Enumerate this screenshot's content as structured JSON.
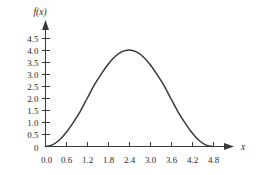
{
  "chart_data": {
    "type": "line",
    "title": "",
    "xlabel": "x",
    "ylabel": "f(x)",
    "xlim": [
      0.0,
      5.1
    ],
    "ylim": [
      0.0,
      4.75
    ],
    "grid": false,
    "legend": null,
    "xticks": [
      "0.0",
      "0.6",
      "1.2",
      "1.8",
      "2.4",
      "3.0",
      "3.6",
      "4.2",
      "4.8"
    ],
    "xtick_values": [
      0.0,
      0.6,
      1.2,
      1.8,
      2.4,
      3.0,
      3.6,
      4.2,
      4.8
    ],
    "yticks": [
      "0",
      "0.5",
      "1.0",
      "1.5",
      "2.0",
      "2.5",
      "3.0",
      "3.5",
      "4.0",
      "4.5"
    ],
    "ytick_values": [
      0.0,
      0.5,
      1.0,
      1.5,
      2.0,
      2.5,
      3.0,
      3.5,
      4.0,
      4.5
    ],
    "curve_color": "#3a3a3a",
    "axis_color": "#3a3a3a",
    "series": [
      {
        "name": "f(x)",
        "x": [
          0.0,
          0.2,
          0.4,
          0.6,
          0.8,
          1.0,
          1.2,
          1.4,
          1.6,
          1.8,
          2.0,
          2.2,
          2.4,
          2.6,
          2.8,
          3.0,
          3.2,
          3.4,
          3.6,
          3.8,
          4.0,
          4.2,
          4.4,
          4.6,
          4.8
        ],
        "values": [
          0.0,
          0.07,
          0.27,
          0.59,
          1.0,
          1.46,
          2.0,
          2.54,
          3.0,
          3.41,
          3.73,
          3.93,
          4.0,
          3.93,
          3.73,
          3.41,
          3.0,
          2.54,
          2.0,
          1.46,
          1.0,
          0.59,
          0.27,
          0.07,
          0.0
        ]
      }
    ]
  }
}
